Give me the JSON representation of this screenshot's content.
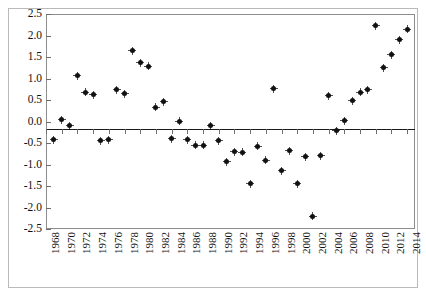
{
  "chart_data": {
    "type": "scatter",
    "title": "",
    "xlabel": "",
    "ylabel": "",
    "xlim": [
      1968,
      2015
    ],
    "ylim": [
      -2.5,
      2.5
    ],
    "ytick_labels": [
      "2.5",
      "2.0",
      "1.5",
      "1.0",
      "0.5",
      "0.0",
      "-0.5",
      "-1.0",
      "-1.5",
      "-2.0",
      "-2.5"
    ],
    "ytick_values": [
      2.5,
      2.0,
      1.5,
      1.0,
      0.5,
      0.0,
      -0.5,
      -1.0,
      -1.5,
      -2.0,
      -2.5
    ],
    "xtick_labels": [
      "1968",
      "1970",
      "1972",
      "1974",
      "1976",
      "1978",
      "1980",
      "1982",
      "1984",
      "1986",
      "1988",
      "1990",
      "1992",
      "1994",
      "1996",
      "1998",
      "2000",
      "2002",
      "2004",
      "2006",
      "2008",
      "2010",
      "2012",
      "2014"
    ],
    "xtick_values": [
      1968,
      1970,
      1972,
      1974,
      1976,
      1978,
      1980,
      1982,
      1984,
      1986,
      1988,
      1990,
      1992,
      1994,
      1996,
      1998,
      2000,
      2002,
      2004,
      2006,
      2008,
      2010,
      2012,
      2014
    ],
    "grid": false,
    "legend": false,
    "zero_line": true,
    "marker": "filled-diamond-plus",
    "marker_color": "#111111",
    "x": [
      1969,
      1970,
      1971,
      1972,
      1973,
      1974,
      1975,
      1976,
      1977,
      1978,
      1979,
      1980,
      1981,
      1982,
      1983,
      1984,
      1985,
      1986,
      1987,
      1988,
      1989,
      1990,
      1991,
      1992,
      1993,
      1994,
      1995,
      1996,
      1997,
      1998,
      1999,
      2000,
      2001,
      2002,
      2003,
      2004,
      2005,
      2006,
      2007,
      2008,
      2009,
      2010,
      2011,
      2012,
      2013,
      2014
    ],
    "y": [
      -0.42,
      0.04,
      -0.1,
      1.06,
      0.68,
      0.62,
      -0.45,
      -0.42,
      0.74,
      0.65,
      1.64,
      1.37,
      1.29,
      0.33,
      0.46,
      -0.4,
      0.01,
      -0.43,
      -0.55,
      -0.55,
      -0.1,
      -0.45,
      -0.94,
      -0.7,
      -0.72,
      -1.45,
      -0.57,
      -0.9,
      0.76,
      -1.15,
      -0.68,
      -1.45,
      -0.82,
      -2.2,
      -0.8,
      0.6,
      -0.22,
      0.02,
      0.48,
      0.68,
      0.74,
      2.23,
      1.25,
      1.55,
      1.9,
      2.15
    ],
    "series_name": ""
  },
  "figure": {
    "axis_color": "#8d8d8d",
    "zero_line_color": "#1a1a1a",
    "background": "#ffffff",
    "border_color": "#b9b9b9"
  }
}
